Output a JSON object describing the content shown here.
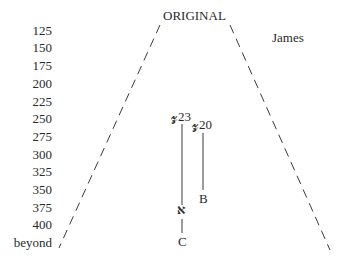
{
  "diagram": {
    "title": "ORIGINAL",
    "book_label": "James",
    "y_axis": {
      "ticks": [
        "125",
        "150",
        "175",
        "200",
        "225",
        "250",
        "275",
        "300",
        "325",
        "350",
        "375",
        "400",
        "beyond"
      ]
    },
    "manuscripts": [
      {
        "label": "𝔃23",
        "end_label": "א",
        "continuation_label": "C"
      },
      {
        "label": "𝔃20",
        "end_label": "B"
      }
    ],
    "colors": {
      "text": "#2a2a2a",
      "lines": "#3a3a3a",
      "background": "#ffffff"
    }
  }
}
